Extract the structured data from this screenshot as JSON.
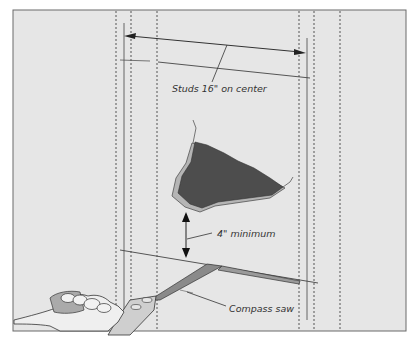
{
  "diagram": {
    "type": "illustration",
    "labels": {
      "studs": "Studs 16\" on center",
      "minimum": "4\" minimum",
      "saw": "Compass saw"
    },
    "colors": {
      "panel_background": "#e6e6e6",
      "frame_border": "#6a6a6a",
      "hole_fill": "#4d4d4d",
      "hole_edge": "#b5b5b5",
      "line": "#333333",
      "saw_blade": "#8a8a8a",
      "hand": "#efefef"
    },
    "studs_dashed_x": [
      116,
      131,
      157,
      299,
      314,
      340
    ]
  }
}
